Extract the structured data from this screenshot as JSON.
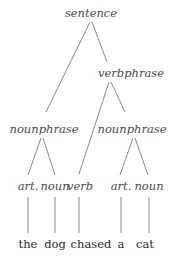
{
  "tree": {
    "root": "sentence",
    "nodes": {
      "sentence": "sentence",
      "verbphrase": "verbphrase",
      "nounphrase_subject": "nounphrase",
      "nounphrase_object": "nounphrase",
      "art_1": "art.",
      "noun_1": "noun",
      "verb": "verb",
      "art_2": "art.",
      "noun_2": "noun"
    },
    "words": [
      "the",
      "dog",
      "chased",
      "a",
      "cat"
    ],
    "edges": [
      [
        "sentence",
        "nounphrase_subject"
      ],
      [
        "sentence",
        "verbphrase"
      ],
      [
        "verbphrase",
        "verb"
      ],
      [
        "verbphrase",
        "nounphrase_object"
      ],
      [
        "nounphrase_subject",
        "art_1"
      ],
      [
        "nounphrase_subject",
        "noun_1"
      ],
      [
        "nounphrase_object",
        "art_2"
      ],
      [
        "nounphrase_object",
        "noun_2"
      ],
      [
        "art_1",
        "word_0"
      ],
      [
        "noun_1",
        "word_1"
      ],
      [
        "verb",
        "word_2"
      ],
      [
        "art_2",
        "word_3"
      ],
      [
        "noun_2",
        "word_4"
      ]
    ]
  }
}
